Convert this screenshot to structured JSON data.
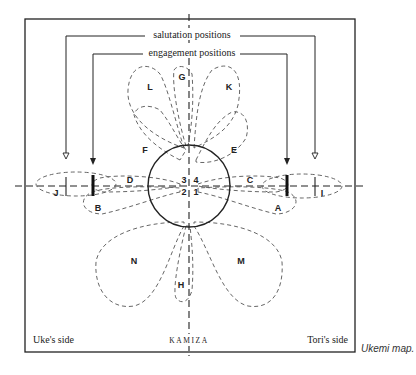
{
  "title": "Ukemi map",
  "caption": "Ukemi map.",
  "labels": {
    "salutation": "salutation positions",
    "engagement": "engagement positions",
    "uke_side": "Uke's side",
    "tori_side": "Tori's side",
    "kamiza": "KAMIZA"
  },
  "zones": {
    "A": "A",
    "B": "B",
    "C": "C",
    "D": "D",
    "E": "E",
    "F": "F",
    "G": "G",
    "H": "H",
    "I": "I",
    "J": "J",
    "K": "K",
    "L": "L",
    "M": "M",
    "N": "N"
  },
  "quadrants": {
    "q1": "1",
    "q2": "2",
    "q3": "3",
    "q4": "4"
  },
  "colors": {
    "line": "#222222",
    "dashed": "#555555",
    "background": "#ffffff"
  }
}
